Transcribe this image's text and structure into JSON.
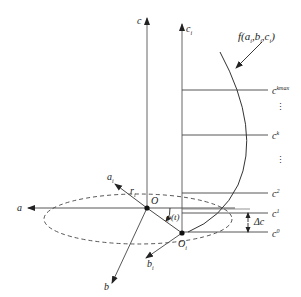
{
  "diagram": {
    "axes": {
      "a": "a",
      "b": "b",
      "c": "c",
      "a_i": "a",
      "a_i_sub": "i",
      "b_i": "b",
      "b_i_sub": "i",
      "c_i": "c",
      "c_i_sub": "i"
    },
    "points": {
      "origin": "O",
      "origin_i": "O",
      "origin_i_sub": "i"
    },
    "radius": {
      "text": "r",
      "sub": "i"
    },
    "angle": "φ(t)",
    "function_label": {
      "prefix": "f(",
      "a": "a",
      "a_sub": "i",
      "b": "b",
      "b_sub": "i",
      "c": "c",
      "c_sub": "i",
      "suffix": ")"
    },
    "levels": [
      {
        "name": "c",
        "sup": "kmax"
      },
      {
        "name": "c",
        "sup": "k"
      },
      {
        "name": "c",
        "sup": "2"
      },
      {
        "name": "c",
        "sup": "1"
      },
      {
        "name": "c",
        "sup": "0"
      }
    ],
    "ellipsis": "⋮",
    "delta": "Δc",
    "colors": {
      "line": "#333333",
      "axis": "#444444",
      "background": "#ffffff"
    }
  }
}
